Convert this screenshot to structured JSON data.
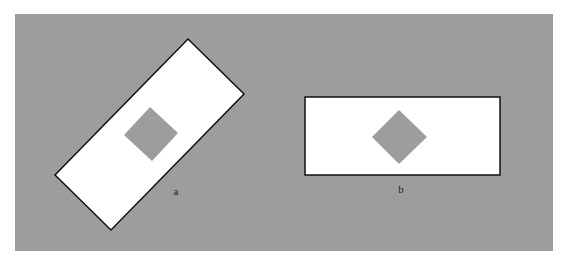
{
  "figure": {
    "background_color": "#9d9d9d",
    "rect_fill": "#ffffff",
    "rect_stroke": "#111111",
    "diamond_fill": "#9d9d9d",
    "panels": [
      {
        "id": "a",
        "label": "a",
        "description": "rectangle rotated 45 degrees with inner square"
      },
      {
        "id": "b",
        "label": "b",
        "description": "axis-aligned rectangle with inner diamond"
      }
    ]
  }
}
